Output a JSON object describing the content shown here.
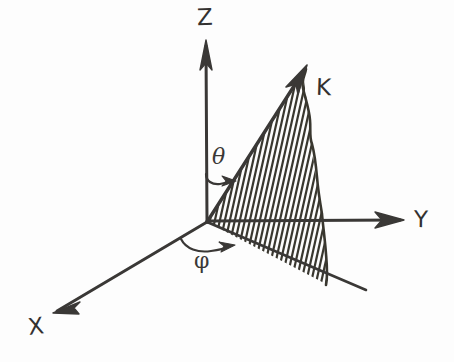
{
  "figure": {
    "background_color": "#fdfdfd",
    "ink_color": "#3a3836",
    "width": 454,
    "height": 362
  },
  "axes": [
    {
      "id": "z",
      "label": "Z",
      "origin": [
        207,
        222
      ],
      "tip": [
        206,
        42
      ],
      "arrowhead": true
    },
    {
      "id": "y",
      "label": "Y",
      "origin": [
        207,
        222
      ],
      "tip": [
        402,
        220
      ],
      "arrowhead": true
    },
    {
      "id": "x",
      "label": "X",
      "origin": [
        207,
        222
      ],
      "tip": [
        55,
        312
      ],
      "arrowhead": true
    }
  ],
  "vector": {
    "id": "k",
    "label": "K",
    "origin": [
      207,
      222
    ],
    "tip": [
      306,
      67
    ],
    "arrowhead": true
  },
  "extension_line": {
    "id": "negative-x-extension",
    "from": [
      207,
      222
    ],
    "to": [
      366,
      290
    ],
    "arrowhead": false
  },
  "angles": [
    {
      "id": "theta",
      "label": "θ",
      "symbol_name": "theta",
      "between": [
        "z",
        "k"
      ],
      "arc_from": [
        207,
        176
      ],
      "arc_to": [
        234,
        182
      ],
      "label_pos": [
        222,
        157
      ]
    },
    {
      "id": "phi",
      "label": "φ",
      "symbol_name": "phi",
      "between": [
        "x",
        "k-projection"
      ],
      "arc_from": [
        182,
        240
      ],
      "arc_to": [
        234,
        247
      ],
      "label_pos": [
        204,
        261
      ]
    }
  ],
  "hatched_region": {
    "id": "k-sector",
    "description": "Hatched sector swept between the K vector and its projection onto the XY plane",
    "hatch_angle_deg": 78,
    "hatch_spacing_px": 4.6,
    "boundary_top_edge": "k-vector",
    "boundary_right_edge": "rough-curve",
    "boundary_bottom_edge": "negative-x-extension"
  },
  "labels": {
    "z": "Z",
    "y": "Y",
    "x": "X",
    "k": "K",
    "theta": "θ",
    "phi": "φ"
  }
}
